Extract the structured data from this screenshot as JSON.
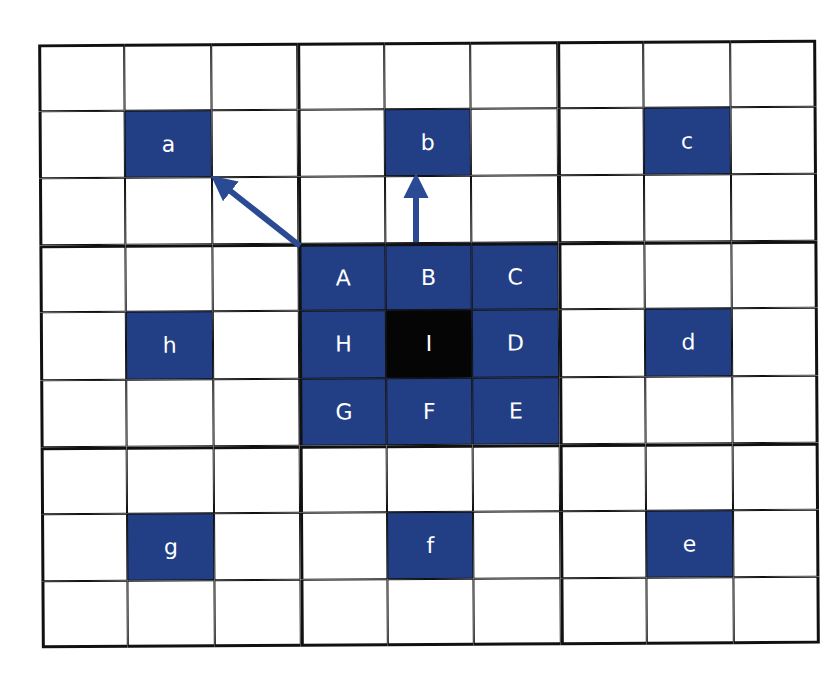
{
  "diagram": {
    "grid_size": 9,
    "block_size": 3,
    "colors": {
      "blue": "#223f86",
      "black": "#050505",
      "line": "#111111",
      "label": "#ffffff"
    },
    "cells": [
      {
        "row": 1,
        "col": 1,
        "label": "a",
        "fill": "blue"
      },
      {
        "row": 1,
        "col": 4,
        "label": "b",
        "fill": "blue"
      },
      {
        "row": 1,
        "col": 7,
        "label": "c",
        "fill": "blue"
      },
      {
        "row": 3,
        "col": 3,
        "label": "A",
        "fill": "blue"
      },
      {
        "row": 3,
        "col": 4,
        "label": "B",
        "fill": "blue"
      },
      {
        "row": 3,
        "col": 5,
        "label": "C",
        "fill": "blue"
      },
      {
        "row": 4,
        "col": 1,
        "label": "h",
        "fill": "blue"
      },
      {
        "row": 4,
        "col": 3,
        "label": "H",
        "fill": "blue"
      },
      {
        "row": 4,
        "col": 4,
        "label": "I",
        "fill": "black"
      },
      {
        "row": 4,
        "col": 5,
        "label": "D",
        "fill": "blue"
      },
      {
        "row": 4,
        "col": 7,
        "label": "d",
        "fill": "blue"
      },
      {
        "row": 5,
        "col": 3,
        "label": "G",
        "fill": "blue"
      },
      {
        "row": 5,
        "col": 4,
        "label": "F",
        "fill": "blue"
      },
      {
        "row": 5,
        "col": 5,
        "label": "E",
        "fill": "blue"
      },
      {
        "row": 7,
        "col": 1,
        "label": "g",
        "fill": "blue"
      },
      {
        "row": 7,
        "col": 4,
        "label": "f",
        "fill": "blue"
      },
      {
        "row": 7,
        "col": 7,
        "label": "e",
        "fill": "blue"
      }
    ],
    "arrows": [
      {
        "from": "A",
        "to": "a",
        "color": "#2a4a94"
      },
      {
        "from": "B",
        "to": "b",
        "color": "#2a4a94"
      }
    ]
  }
}
